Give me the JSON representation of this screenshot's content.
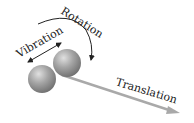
{
  "diagram": {
    "labels": {
      "rotation": "Rotation",
      "vibration": "Vibration",
      "translation": "Translation"
    },
    "colors": {
      "sphere": "#8a8a8a",
      "sphere_highlight": "#d9d9d9",
      "arrow_dark": "#222222",
      "translation_arrow": "#a9a9a9"
    }
  }
}
